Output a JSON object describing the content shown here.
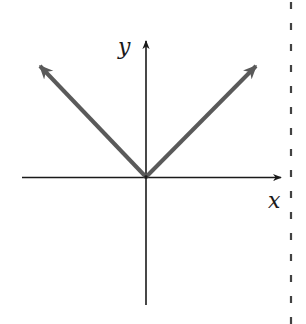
{
  "diagram": {
    "type": "function-graph",
    "axes": {
      "x_label": "x",
      "y_label": "y",
      "axis_color": "#1a1a1a"
    },
    "curve": {
      "shape": "V",
      "color": "#555555",
      "rays": [
        {
          "name": "left-ray",
          "direction": "up-left"
        },
        {
          "name": "right-ray",
          "direction": "up-right"
        }
      ]
    },
    "margin_line": {
      "style": "dashed",
      "color": "#222222"
    }
  }
}
